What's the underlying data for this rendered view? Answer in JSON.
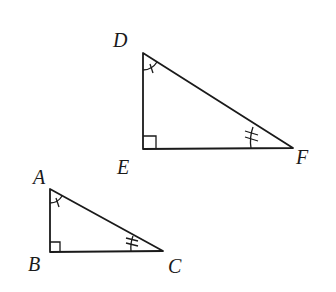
{
  "diagram": {
    "type": "similar-right-triangles",
    "colors": {
      "stroke": "#1a1a1a",
      "background": "#ffffff"
    },
    "triangles": [
      {
        "name": "DEF",
        "vertices": {
          "D": {
            "label": "D",
            "x": 143,
            "y": 53
          },
          "E": {
            "label": "E",
            "x": 143,
            "y": 149
          },
          "F": {
            "label": "F",
            "x": 293,
            "y": 148
          }
        },
        "right_angle_at": "E",
        "single_arc_tick_at": "D",
        "double_tick_at": "F"
      },
      {
        "name": "ABC",
        "vertices": {
          "A": {
            "label": "A",
            "x": 50,
            "y": 189
          },
          "B": {
            "label": "B",
            "x": 50,
            "y": 252
          },
          "C": {
            "label": "C",
            "x": 163,
            "y": 251
          }
        },
        "right_angle_at": "B",
        "single_arc_tick_at": "A",
        "double_tick_at": "C"
      }
    ],
    "labels": {
      "D": "D",
      "E": "E",
      "F": "F",
      "A": "A",
      "B": "B",
      "C": "C"
    }
  }
}
